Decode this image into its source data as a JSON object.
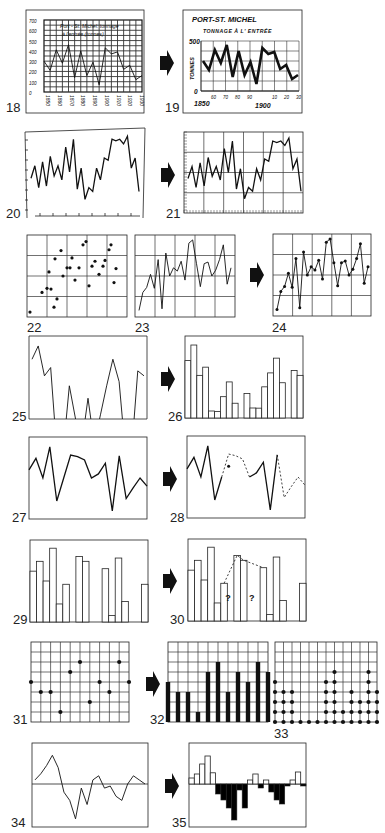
{
  "figure": {
    "panels": [
      {
        "id": "18",
        "label": "18",
        "type": "line-hand-drawn-grid",
        "title_line1": "Port - St. Michel: tonnage",
        "title_line2": "à l'entrée (tonnes)",
        "y_ticks": [
          "700",
          "600",
          "500",
          "400",
          "300",
          "200",
          "100",
          "0"
        ],
        "x_ticks": [
          "1850",
          "1860",
          "1870",
          "1880",
          "1890",
          "1900",
          "1910",
          "1920",
          "1930"
        ]
      },
      {
        "id": "19",
        "label": "19",
        "type": "line-redrawn",
        "title_line1": "PORT-ST. MICHEL",
        "title_line2": "TONNAGE À L' ENTRÉE",
        "ylabel": "TONNES",
        "y_ticks": [
          "500",
          "0"
        ],
        "x_ticks_major": [
          "1850",
          "1900"
        ],
        "x_ticks_minor": [
          "60",
          "70",
          "80",
          "90",
          "10",
          "20",
          "30"
        ]
      },
      {
        "id": "20",
        "label": "20",
        "type": "line-unframed"
      },
      {
        "id": "21",
        "label": "21",
        "type": "line-gridded"
      },
      {
        "id": "22",
        "label": "22",
        "type": "scatter-grid"
      },
      {
        "id": "23",
        "label": "23",
        "type": "line-grid"
      },
      {
        "id": "24",
        "label": "24",
        "type": "line-with-points"
      },
      {
        "id": "25",
        "label": "25",
        "type": "line-clipped"
      },
      {
        "id": "26",
        "label": "26",
        "type": "bars-outline"
      },
      {
        "id": "27",
        "label": "27",
        "type": "line"
      },
      {
        "id": "28",
        "label": "28",
        "type": "line-with-dashed-gaps"
      },
      {
        "id": "29",
        "label": "29",
        "type": "bars-outline-overlapping"
      },
      {
        "id": "30",
        "label": "30",
        "type": "bars-with-missing",
        "annotations": [
          "?",
          "?"
        ]
      },
      {
        "id": "31",
        "label": "31",
        "type": "dot-grid"
      },
      {
        "id": "32",
        "label": "32",
        "type": "bars-filled-grid"
      },
      {
        "id": "33",
        "label": "33",
        "type": "stacked-dots"
      },
      {
        "id": "34",
        "label": "34",
        "type": "line-with-baseline"
      },
      {
        "id": "35",
        "label": "35",
        "type": "bars-positive-negative"
      }
    ],
    "arrows": [
      "19",
      "21",
      "24",
      "26",
      "28",
      "30",
      "32",
      "35"
    ]
  },
  "chart_data": [
    {
      "id": "18",
      "type": "line",
      "title": "Port - St. Michel: tonnage à l'entrée (tonnes)",
      "xlabel": "",
      "ylabel": "",
      "ylim": [
        0,
        700
      ],
      "x": [
        1850,
        1855,
        1860,
        1865,
        1870,
        1875,
        1880,
        1885,
        1890,
        1895,
        1900,
        1905,
        1910,
        1915,
        1920,
        1925,
        1930
      ],
      "values": [
        300,
        210,
        410,
        280,
        460,
        140,
        400,
        160,
        290,
        70,
        430,
        370,
        390,
        220,
        260,
        120,
        160
      ],
      "grid": true
    },
    {
      "id": "19",
      "type": "line",
      "title": "PORT-ST. MICHEL — TONNAGE À L' ENTRÉE",
      "xlabel": "",
      "ylabel": "TONNES",
      "ylim": [
        0,
        500
      ],
      "x": [
        1850,
        1855,
        1860,
        1865,
        1870,
        1875,
        1880,
        1885,
        1890,
        1895,
        1900,
        1905,
        1910,
        1915,
        1920,
        1925,
        1930
      ],
      "values": [
        300,
        210,
        410,
        280,
        460,
        140,
        400,
        160,
        290,
        70,
        430,
        370,
        390,
        220,
        260,
        120,
        160
      ],
      "grid": true
    },
    {
      "id": "20",
      "type": "line",
      "values": [
        42,
        58,
        30,
        63,
        32,
        70,
        45,
        58,
        40,
        82,
        50,
        92,
        28,
        55,
        15,
        30,
        25,
        55,
        40,
        68,
        65,
        92,
        90,
        92,
        86,
        96,
        55,
        68,
        25
      ],
      "ylim": [
        0,
        100
      ],
      "grid": false
    },
    {
      "id": "21",
      "type": "line",
      "values": [
        42,
        58,
        30,
        63,
        32,
        70,
        45,
        58,
        40,
        82,
        50,
        92,
        28,
        55,
        15,
        30,
        25,
        55,
        40,
        68,
        65,
        92,
        90,
        92,
        86,
        96,
        55,
        68,
        25
      ],
      "ylim": [
        0,
        100
      ],
      "grid": true
    },
    {
      "id": "22",
      "type": "scatter",
      "points": [
        [
          3,
          6
        ],
        [
          15,
          30
        ],
        [
          20,
          35
        ],
        [
          22,
          55
        ],
        [
          24,
          34
        ],
        [
          27,
          12
        ],
        [
          28,
          71
        ],
        [
          30,
          22
        ],
        [
          34,
          81
        ],
        [
          36,
          50
        ],
        [
          40,
          60
        ],
        [
          43,
          60
        ],
        [
          45,
          72
        ],
        [
          48,
          45
        ],
        [
          52,
          60
        ],
        [
          56,
          88
        ],
        [
          59,
          92
        ],
        [
          62,
          38
        ],
        [
          65,
          62
        ],
        [
          68,
          68
        ],
        [
          72,
          52
        ],
        [
          76,
          62
        ],
        [
          78,
          69
        ],
        [
          82,
          82
        ],
        [
          84,
          88
        ],
        [
          87,
          42
        ],
        [
          89,
          59
        ]
      ],
      "xlim": [
        0,
        100
      ],
      "ylim": [
        0,
        100
      ],
      "grid": true
    },
    {
      "id": "23",
      "type": "line",
      "values": [
        8,
        30,
        36,
        52,
        35,
        70,
        10,
        78,
        50,
        60,
        56,
        68,
        45,
        90,
        94,
        65,
        37,
        65,
        67,
        50,
        57,
        70,
        88,
        40,
        60
      ],
      "ylim": [
        0,
        100
      ],
      "grid": true
    },
    {
      "id": "24",
      "type": "line",
      "values": [
        8,
        30,
        36,
        52,
        35,
        70,
        10,
        78,
        50,
        60,
        56,
        68,
        45,
        90,
        94,
        65,
        37,
        65,
        67,
        50,
        57,
        70,
        88,
        40,
        60
      ],
      "ylim": [
        0,
        100
      ],
      "grid": true,
      "markers": true
    },
    {
      "id": "25",
      "type": "line",
      "values": [
        72,
        88,
        52,
        62,
        -40,
        -40,
        40,
        0,
        -30,
        25,
        -30,
        5,
        40,
        72,
        45,
        -40,
        -40,
        58,
        52
      ],
      "ylim": [
        0,
        100
      ],
      "clipped": true
    },
    {
      "id": "26",
      "type": "bar",
      "values": [
        70,
        89,
        52,
        62,
        -5,
        8,
        26,
        44,
        18,
        -5,
        30,
        -5,
        12,
        38,
        55,
        73,
        43,
        -5,
        58,
        52
      ],
      "ylim": [
        0,
        100
      ]
    },
    {
      "id": "27",
      "type": "line",
      "values": [
        60,
        74,
        50,
        88,
        22,
        50,
        78,
        76,
        72,
        50,
        55,
        68,
        10,
        77,
        25,
        38,
        50,
        40
      ],
      "ylim": [
        0,
        100
      ]
    },
    {
      "id": "28",
      "type": "line",
      "values": [
        60,
        74,
        50,
        88,
        22,
        50,
        78,
        76,
        72,
        50,
        55,
        68,
        10,
        77,
        25,
        38,
        50,
        40
      ],
      "ylim": [
        0,
        100
      ],
      "dashed_segments": [
        [
          5,
          9
        ],
        [
          13,
          17
        ]
      ],
      "marked_point": [
        6,
        63
      ]
    },
    {
      "id": "29",
      "type": "bar",
      "values": [
        62,
        74,
        50,
        90,
        22,
        46,
        0,
        80,
        74,
        0,
        0,
        65,
        8,
        78,
        25,
        0,
        0,
        46
      ],
      "ylim": [
        0,
        100
      ]
    },
    {
      "id": "30",
      "type": "bar",
      "values": [
        62,
        74,
        50,
        90,
        22,
        46,
        0,
        80,
        74,
        0,
        0,
        65,
        8,
        78,
        25,
        0,
        0,
        46
      ],
      "ylim": [
        0,
        100
      ],
      "interpolated": [
        [
          5,
          46
        ],
        [
          7,
          80
        ],
        [
          8,
          74
        ],
        [
          11,
          65
        ]
      ],
      "annotations": [
        "?",
        "?"
      ]
    },
    {
      "id": "31",
      "type": "scatter",
      "points": [
        [
          0,
          4
        ],
        [
          1,
          3
        ],
        [
          2,
          3
        ],
        [
          3,
          1
        ],
        [
          4,
          5
        ],
        [
          5,
          6
        ],
        [
          6,
          2
        ],
        [
          7,
          4
        ],
        [
          8,
          3
        ],
        [
          9,
          6
        ],
        [
          10,
          4
        ]
      ],
      "xlim": [
        0,
        10
      ],
      "ylim": [
        0,
        8
      ],
      "grid": true
    },
    {
      "id": "32",
      "type": "bar",
      "values": [
        4,
        3,
        3,
        1,
        5,
        6,
        3,
        5,
        4,
        6,
        5
      ],
      "ylim": [
        0,
        8
      ],
      "grid": true
    },
    {
      "id": "33",
      "type": "stacked-dots",
      "values": [
        5,
        4,
        4,
        1,
        1,
        1,
        5,
        6,
        2,
        4,
        3,
        6,
        4
      ],
      "ylim": [
        0,
        8
      ],
      "grid": true
    },
    {
      "id": "34",
      "type": "line",
      "values": [
        10,
        25,
        45,
        70,
        40,
        -20,
        -40,
        -85,
        -10,
        -50,
        10,
        20,
        -10,
        -5,
        -30,
        -40,
        0,
        20,
        10,
        0
      ],
      "ylim": [
        -100,
        100
      ],
      "baseline": 0
    },
    {
      "id": "35",
      "type": "bar",
      "values": [
        15,
        25,
        50,
        70,
        28,
        -25,
        -40,
        -60,
        -90,
        -15,
        -60,
        10,
        25,
        -10,
        10,
        -20,
        -40,
        -50,
        -5,
        10,
        30,
        -5
      ],
      "ylim": [
        -100,
        100
      ],
      "positive_fill": "#ffffff",
      "negative_fill": "#000000"
    }
  ]
}
